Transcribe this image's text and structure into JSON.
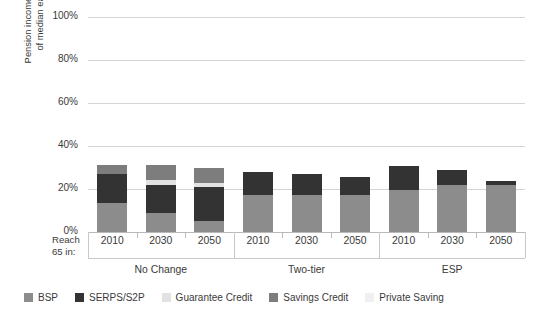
{
  "chart_data": {
    "type": "bar",
    "stacked": true,
    "title": "",
    "xlabel": "Reach 65 in:",
    "ylabel": "Pension income as percentage of median earnings at 75",
    "ylim": [
      0,
      100
    ],
    "yticks": [
      0,
      20,
      40,
      60,
      80,
      100
    ],
    "ytick_labels": [
      "0%",
      "20%",
      "40%",
      "60%",
      "80%",
      "100%"
    ],
    "grid": true,
    "legend_position": "bottom",
    "groups": [
      "No Change",
      "Two-tier",
      "ESP"
    ],
    "categories": [
      "2010",
      "2030",
      "2050",
      "2010",
      "2030",
      "2050",
      "2010",
      "2030",
      "2050"
    ],
    "series": [
      {
        "name": "BSP",
        "color": "#8c8c8c",
        "values": [
          13.5,
          9.0,
          5.0,
          17.0,
          17.0,
          17.0,
          19.5,
          22.0,
          22.0
        ]
      },
      {
        "name": "SERPS/S2P",
        "color": "#333333",
        "values": [
          13.5,
          13.0,
          16.0,
          11.0,
          10.0,
          8.5,
          11.0,
          7.0,
          1.5
        ]
      },
      {
        "name": "Guarantee Credit",
        "color": "#e2e2e2",
        "values": [
          0.0,
          2.0,
          2.0,
          0.0,
          0.0,
          0.0,
          0.0,
          0.0,
          0.0
        ]
      },
      {
        "name": "Savings Credit",
        "color": "#7d7d7d",
        "values": [
          4.0,
          7.0,
          7.0,
          0.0,
          0.0,
          0.0,
          0.0,
          0.0,
          0.0
        ]
      },
      {
        "name": "Private Saving",
        "color": "#f0f0f0",
        "values": [
          0.0,
          0.0,
          0.0,
          0.0,
          0.0,
          0.0,
          0.0,
          0.0,
          0.0
        ]
      }
    ],
    "bar_totals": [
      31.0,
      31.0,
      30.0,
      28.0,
      27.0,
      25.5,
      30.5,
      29.0,
      23.5
    ]
  },
  "axis": {
    "reach_line1": "Reach",
    "reach_line2": "65 in:",
    "y_title_line1": "Pension income as percentage",
    "y_title_line2": "of median earnings at 75"
  },
  "legend": {
    "items": [
      {
        "label": "BSP",
        "color": "#8c8c8c"
      },
      {
        "label": "SERPS/S2P",
        "color": "#333333"
      },
      {
        "label": "Guarantee Credit",
        "color": "#e2e2e2"
      },
      {
        "label": "Savings Credit",
        "color": "#7d7d7d"
      },
      {
        "label": "Private Saving",
        "color": "#f0f0f0"
      }
    ]
  }
}
